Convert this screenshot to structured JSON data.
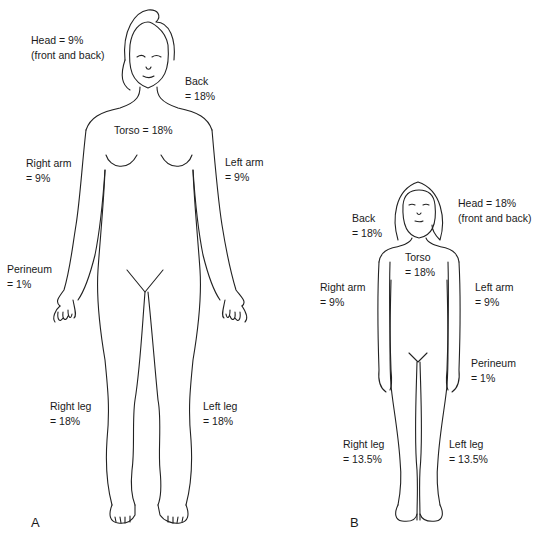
{
  "figure_a": {
    "panel_label": "A",
    "subject": "adult",
    "labels": {
      "head": {
        "line1": "Head = 9%",
        "line2": "(front and back)"
      },
      "back": {
        "line1": "Back",
        "line2": "= 18%"
      },
      "torso": {
        "line1": "Torso = 18%"
      },
      "right_arm": {
        "line1": "Right arm",
        "line2": "= 9%"
      },
      "left_arm": {
        "line1": "Left arm",
        "line2": "= 9%"
      },
      "perineum": {
        "line1": "Perineum",
        "line2": "= 1%"
      },
      "right_leg": {
        "line1": "Right leg",
        "line2": "= 18%"
      },
      "left_leg": {
        "line1": "Left leg",
        "line2": "= 18%"
      }
    }
  },
  "figure_b": {
    "panel_label": "B",
    "subject": "child",
    "labels": {
      "head": {
        "line1": "Head = 18%",
        "line2": "(front and back)"
      },
      "back": {
        "line1": "Back",
        "line2": "= 18%"
      },
      "torso": {
        "line1": "Torso",
        "line2": "= 18%"
      },
      "right_arm": {
        "line1": "Right arm",
        "line2": "= 9%"
      },
      "left_arm": {
        "line1": "Left arm",
        "line2": "= 9%"
      },
      "perineum": {
        "line1": "Perineum",
        "line2": "= 1%"
      },
      "right_leg": {
        "line1": "Right leg",
        "line2": "= 13.5%"
      },
      "left_leg": {
        "line1": "Left leg",
        "line2": "= 13.5%"
      }
    }
  }
}
